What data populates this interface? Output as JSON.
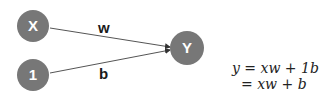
{
  "diagram": {
    "node_color": "#777777",
    "edge_color": "#555555",
    "nodes": [
      {
        "id": "x",
        "label": "X"
      },
      {
        "id": "one",
        "label": "1"
      },
      {
        "id": "y",
        "label": "Y"
      }
    ],
    "edges": [
      {
        "from": "x",
        "to": "y",
        "label": "w"
      },
      {
        "from": "one",
        "to": "y",
        "label": "b"
      }
    ],
    "equations": [
      "y = xw + 1b",
      "= xw + b"
    ]
  }
}
